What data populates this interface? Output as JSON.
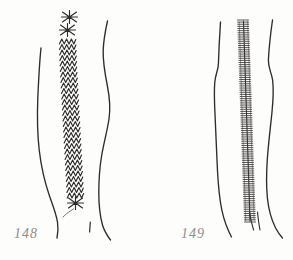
{
  "plate": {
    "background_color": "#fdfdfc",
    "ink_color": "#2e2c2b",
    "label_color": "#8e8d8a",
    "width": 293,
    "height": 260
  },
  "figures": [
    {
      "label": "148",
      "label_x": 14,
      "label_y": 226,
      "seam_style": "braided-chevron-stitch",
      "description": "Garment panel seam worked in stacked chevron / braid stitch with cross-stitch marks terminating each end",
      "seam": {
        "x_top": 67,
        "x_bottom": 76,
        "y_top": 14,
        "y_bottom": 209,
        "chevron_count": 34,
        "cross_marks_top": 2,
        "cross_marks_bottom": 2,
        "stitch_width": 17
      },
      "left_outline": {
        "y_top": 48,
        "y_bottom": 238,
        "points": "41,48 40,70 38,96 37,120 38,146 42,172 47,192 52,206 56,216 58,228 57,238"
      },
      "right_outline": {
        "y_top": 21,
        "y_bottom": 240,
        "points": "107,21 104,36 103,52 105,70 108,88 110,104 108,124 104,142 101,162 99,182 99,200 101,216 104,228 110,238"
      },
      "tick_mark": {
        "x": 90,
        "y_top": 222,
        "y_bottom": 232
      }
    },
    {
      "label": "149",
      "label_x": 181,
      "label_y": 226,
      "seam_style": "fine-ladder-blanket-stitch",
      "description": "Garment panel seam worked in a dense fine ladder (blanket) stitch running the full length between the two panel edges",
      "seam": {
        "x_top": 243,
        "x_bottom": 250,
        "y_top": 20,
        "y_bottom": 222,
        "rung_count": 96,
        "rung_width": 11,
        "has_center_line": true
      },
      "left_outline": {
        "y_top": 22,
        "y_bottom": 236,
        "points": "220,22 219,42 218,60 219,72 215,80 214,96 215,118 216,140 217,162 218,182 220,200 224,216 228,228 231,236"
      },
      "right_outline": {
        "y_top": 20,
        "y_bottom": 238,
        "points": "272,20 270,38 268,56 269,68 272,76 273,92 272,112 269,132 267,152 266,172 267,190 270,206 275,220 282,232"
      },
      "tick_marks": [
        {
          "x": 250,
          "y_top": 212,
          "y_bottom": 230
        },
        {
          "x": 257,
          "y_top": 212,
          "y_bottom": 230
        }
      ]
    }
  ]
}
